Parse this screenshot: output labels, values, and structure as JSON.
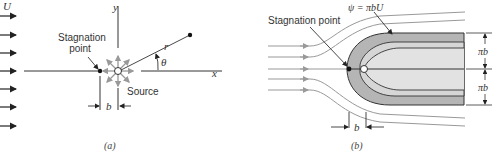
{
  "panel_a": {
    "caption": "(a)",
    "free_stream_label": "U",
    "stagnation_label_line1": "Stagnation",
    "stagnation_label_line2": "point",
    "source_label": "Source",
    "x_axis_label": "x",
    "y_axis_label": "y",
    "r_label": "r",
    "theta_label": "θ",
    "b_label": "b"
  },
  "panel_b": {
    "caption": "(b)",
    "stagnation_label": "Stagnation point",
    "streamline_label": "ψ = πbU",
    "upper_half_width": "πb",
    "lower_half_width": "πb",
    "b_label": "b"
  },
  "colors": {
    "line": "#333333",
    "streamline": "#999999",
    "body_outer": "#b5b5b5",
    "body_inner": "#dcdcdc"
  }
}
